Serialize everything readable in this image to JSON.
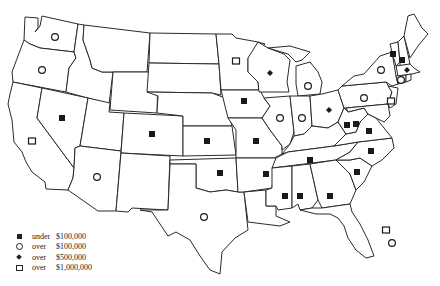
{
  "legend": [
    {
      "symbol": "filled-square",
      "word": "under",
      "amount": "$100,000"
    },
    {
      "symbol": "open-circle",
      "word": "over",
      "amount": "$100,000"
    },
    {
      "symbol": "filled-diamond",
      "word": "over",
      "amount": "$500,000"
    },
    {
      "symbol": "open-square",
      "word": "over",
      "amount": "$1,000,000"
    }
  ],
  "markers": [
    {
      "state": "WA",
      "symbol": "open-circle"
    },
    {
      "state": "OR",
      "symbol": "open-circle"
    },
    {
      "state": "NV",
      "symbol": "filled-square"
    },
    {
      "state": "CA",
      "symbol": "open-square"
    },
    {
      "state": "AZ",
      "symbol": "open-circle"
    },
    {
      "state": "CO",
      "symbol": "filled-square"
    },
    {
      "state": "KS",
      "symbol": "filled-square"
    },
    {
      "state": "OK",
      "symbol": "filled-square"
    },
    {
      "state": "TX",
      "symbol": "open-circle"
    },
    {
      "state": "MN",
      "symbol": "open-square"
    },
    {
      "state": "WI",
      "symbol": "filled-diamond"
    },
    {
      "state": "IA",
      "symbol": "filled-square"
    },
    {
      "state": "MO",
      "symbol": "filled-square"
    },
    {
      "state": "IL",
      "symbol": "open-circle"
    },
    {
      "state": "IN",
      "symbol": "open-circle"
    },
    {
      "state": "MI",
      "symbol": "open-circle"
    },
    {
      "state": "OH",
      "symbol": "filled-diamond"
    },
    {
      "state": "NY",
      "symbol": "open-circle"
    },
    {
      "state": "PA",
      "symbol": "open-circle"
    },
    {
      "state": "VT",
      "symbol": "filled-square"
    },
    {
      "state": "NH",
      "symbol": "filled-square"
    },
    {
      "state": "MA",
      "symbol": "filled-diamond"
    },
    {
      "state": "CT",
      "symbol": "open-circle"
    },
    {
      "state": "NJ",
      "symbol": "open-square"
    },
    {
      "state": "WV",
      "symbol": "filled-square"
    },
    {
      "state": "VA",
      "symbol": "filled-square"
    },
    {
      "state": "KY",
      "symbol": "filled-square"
    },
    {
      "state": "NC",
      "symbol": "filled-square"
    },
    {
      "state": "TN",
      "symbol": "filled-square"
    },
    {
      "state": "SC",
      "symbol": "filled-square"
    },
    {
      "state": "MS",
      "symbol": "filled-square"
    },
    {
      "state": "AL",
      "symbol": "filled-square"
    },
    {
      "state": "GA",
      "symbol": "filled-square"
    },
    {
      "state": "AR",
      "symbol": "filled-square"
    },
    {
      "state": "FL",
      "symbol": "open-square"
    },
    {
      "state": "FL",
      "symbol": "open-circle"
    }
  ]
}
